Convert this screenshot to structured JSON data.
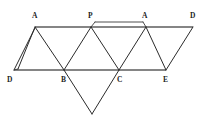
{
  "figure": {
    "background_color": "#ffffff",
    "stroke_color": "#2b2b2b",
    "rail_color": "#5d5d5d",
    "width": 207,
    "height": 118,
    "labels": [
      {
        "id": "label-A-top-left",
        "text": "A",
        "x": 32,
        "y": 12
      },
      {
        "id": "label-P-top",
        "text": "P",
        "x": 88,
        "y": 12
      },
      {
        "id": "label-A-top-right",
        "text": "A",
        "x": 142,
        "y": 12
      },
      {
        "id": "label-D-top-right",
        "text": "D",
        "x": 190,
        "y": 12
      },
      {
        "id": "label-D-bottom-left",
        "text": "D",
        "x": 7,
        "y": 76
      },
      {
        "id": "label-B-bottom",
        "text": "B",
        "x": 61,
        "y": 76
      },
      {
        "id": "label-C-bottom",
        "text": "C",
        "x": 117,
        "y": 76
      },
      {
        "id": "label-E-bottom",
        "text": "E",
        "x": 163,
        "y": 76
      }
    ],
    "vertices": {
      "A_top_left": {
        "x": 35,
        "y": 27
      },
      "P_top": {
        "x": 91,
        "y": 27
      },
      "A_top_right": {
        "x": 146,
        "y": 27
      },
      "D_top_right": {
        "x": 193,
        "y": 27
      },
      "D_bottom_left": {
        "x": 14,
        "y": 70
      },
      "B_bottom": {
        "x": 64,
        "y": 70
      },
      "C_bottom": {
        "x": 119,
        "y": 70
      },
      "E_bottom": {
        "x": 166,
        "y": 70
      },
      "apex_bottom": {
        "x": 92,
        "y": 114
      },
      "flap_outer": {
        "x": 18,
        "y": 69
      },
      "sliver_left": {
        "x": 95,
        "y": 22
      },
      "sliver_right": {
        "x": 143,
        "y": 22
      }
    },
    "edges": [
      {
        "name": "top-rail",
        "from": "A_top_left",
        "to": "D_top_right"
      },
      {
        "name": "bottom-rail",
        "from": "D_bottom_left",
        "to": "E_bottom"
      },
      {
        "name": "flap-upper",
        "from": "A_top_left",
        "to": "flap_outer"
      },
      {
        "name": "flap-lower",
        "from": "A_top_left",
        "to": "D_bottom_left"
      },
      {
        "name": "flap-close",
        "from": "flap_outer",
        "to": "D_bottom_left"
      },
      {
        "name": "A1-B",
        "from": "A_top_left",
        "to": "B_bottom"
      },
      {
        "name": "B-P",
        "from": "B_bottom",
        "to": "P_top"
      },
      {
        "name": "P-C",
        "from": "P_top",
        "to": "C_bottom"
      },
      {
        "name": "C-A2",
        "from": "C_bottom",
        "to": "A_top_right"
      },
      {
        "name": "A2-E",
        "from": "A_top_right",
        "to": "E_bottom"
      },
      {
        "name": "E-D2",
        "from": "E_bottom",
        "to": "D_top_right"
      },
      {
        "name": "B-apex",
        "from": "B_bottom",
        "to": "apex_bottom"
      },
      {
        "name": "apex-C",
        "from": "apex_bottom",
        "to": "C_bottom"
      },
      {
        "name": "sliver-top",
        "from": "sliver_left",
        "to": "sliver_right"
      },
      {
        "name": "sliver-left-cap",
        "from": "sliver_left",
        "to": "P_top"
      },
      {
        "name": "sliver-right-cap",
        "from": "sliver_right",
        "to": "A_top_right"
      }
    ]
  }
}
